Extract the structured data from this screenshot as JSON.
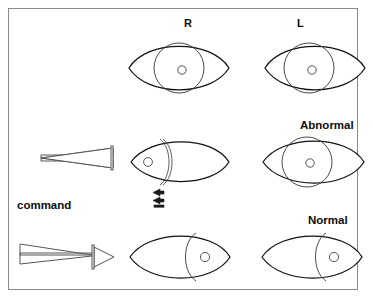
{
  "figure": {
    "border_color": "#8a8a8a",
    "line_color": "#111111",
    "background": "#ffffff"
  },
  "column_headers": [
    {
      "label": "R",
      "name": "right-eye-column-header"
    },
    {
      "label": "L",
      "name": "left-eye-column-header"
    }
  ],
  "row_labels": [
    {
      "label": "Abnormal",
      "name": "abnormal-row-label"
    },
    {
      "label": "Normal",
      "name": "normal-row-label"
    }
  ],
  "command_label": "command",
  "rows": [
    {
      "name": "baseline-row",
      "description": "Resting eye position, both eyes forward",
      "eyes": [
        {
          "side": "R",
          "gaze": "center",
          "iris_visible": "full",
          "pupil": "center"
        },
        {
          "side": "L",
          "gaze": "center-left",
          "iris_visible": "full",
          "pupil": "center"
        }
      ]
    },
    {
      "name": "abnormal-row",
      "description": "Command to look left: right eye fails to adduct fully (abnormal)",
      "command_direction": "left",
      "marker": "double-left-arrow",
      "eyes": [
        {
          "side": "R",
          "gaze": "far-left",
          "iris_visible": "partial-arc",
          "pupil": "far-left"
        },
        {
          "side": "L",
          "gaze": "left",
          "iris_visible": "full",
          "pupil": "center-left"
        }
      ]
    },
    {
      "name": "normal-row",
      "description": "Command to look right: both eyes move right (normal)",
      "command_direction": "right",
      "eyes": [
        {
          "side": "R",
          "gaze": "right",
          "iris_visible": "partial",
          "pupil": "right"
        },
        {
          "side": "L",
          "gaze": "right",
          "iris_visible": "partial",
          "pupil": "right"
        }
      ]
    }
  ],
  "arrows": [
    {
      "name": "command-arrow-left",
      "direction": "left",
      "label": "command"
    },
    {
      "name": "command-arrow-right",
      "direction": "right",
      "label": "command"
    }
  ]
}
